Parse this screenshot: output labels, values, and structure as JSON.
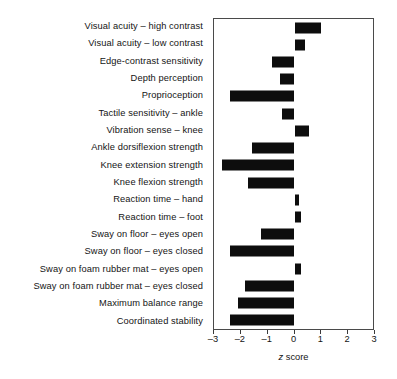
{
  "chart_data": {
    "type": "bar",
    "orientation": "horizontal",
    "title": "",
    "xlabel": "z score",
    "ylabel": "",
    "xlim": [
      -3,
      3
    ],
    "xticks": [
      -3,
      -2,
      -1,
      0,
      1,
      2,
      3
    ],
    "xticklabels": [
      "-3",
      "-2",
      "-1",
      "0",
      "1",
      "2",
      "3"
    ],
    "grid": false,
    "legend": null,
    "bar_color": "#0d0d0d",
    "categories": [
      "Visual acuity – high contrast",
      "Visual acuity – low contrast",
      "Edge-contrast sensitivity",
      "Depth perception",
      "Proprioception",
      "Tactile sensitivity – ankle",
      "Vibration sense – knee",
      "Ankle dorsiflexion strength",
      "Knee extension strength",
      "Knee flexion strength",
      "Reaction time – hand",
      "Reaction time – foot",
      "Sway on floor – eyes open",
      "Sway on floor – eyes closed",
      "Sway on foam rubber mat – eyes open",
      "Sway on foam rubber mat – eyes closed",
      "Maximum balance range",
      "Coordinated stability"
    ],
    "values": [
      1.0,
      0.4,
      -0.85,
      -0.55,
      -2.4,
      -0.45,
      0.55,
      -1.6,
      -2.7,
      -1.75,
      0.15,
      0.25,
      -1.25,
      -2.4,
      0.25,
      -1.85,
      -2.1,
      -2.4
    ]
  }
}
